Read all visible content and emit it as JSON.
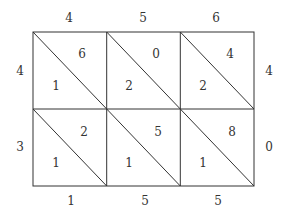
{
  "diagram": {
    "type": "lattice-multiplication",
    "top_digits": [
      "4",
      "5",
      "6"
    ],
    "right_digits": [
      "4",
      "0"
    ],
    "left_digits": [
      "4",
      "3"
    ],
    "bottom_digits": [
      "1",
      "5",
      "5"
    ],
    "cells": [
      [
        {
          "upper": "6",
          "lower": "1"
        },
        {
          "upper": "0",
          "lower": "2"
        },
        {
          "upper": "4",
          "lower": "2"
        }
      ],
      [
        {
          "upper": "2",
          "lower": "1"
        },
        {
          "upper": "5",
          "lower": "1"
        },
        {
          "upper": "8",
          "lower": "1"
        }
      ]
    ],
    "colors": {
      "line": "#333333",
      "background": "#ffffff"
    }
  }
}
